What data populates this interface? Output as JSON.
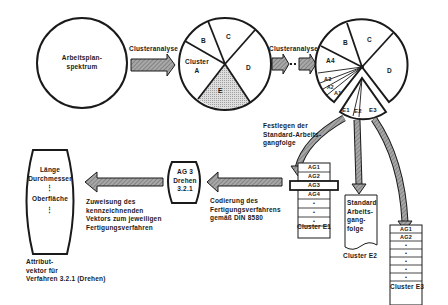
{
  "diagram": {
    "start_circle": {
      "label_line1": "Arbeitsplan-",
      "label_line2": "spektrum"
    },
    "arrow1_label": "Clusteranalyse",
    "arrow2_label": "Clusteranalyse",
    "circle1": {
      "segments": [
        "B",
        "C",
        "D",
        "E"
      ],
      "cluster_a_line1": "Cluster",
      "cluster_a_line2": "A",
      "highlighted_segment": "E",
      "highlight_color": "#cfcfcf"
    },
    "circle2": {
      "segments": [
        "B",
        "C",
        "D",
        "A4",
        "A3",
        "A2",
        "A1"
      ],
      "sub_segments": [
        "E1",
        "E2",
        "E3"
      ]
    },
    "standard_label": {
      "line1": "Festlegen der",
      "line2": "Standard-Arbeits-",
      "line3": "gangfolge"
    },
    "cluster_e1": {
      "rows": [
        "AG1",
        "AG2",
        "AG3",
        "AG4",
        "•",
        "•",
        "•"
      ],
      "caption": "Cluster E1"
    },
    "cluster_e2": {
      "lines": [
        "Standard",
        "Arbeits-",
        "gang-",
        "folge"
      ],
      "caption": "Cluster E2"
    },
    "cluster_e3": {
      "rows": [
        "AG1",
        "AG2",
        "•",
        "•",
        "•",
        "•",
        "•"
      ],
      "caption": "Cluster E3"
    },
    "ag_box": {
      "line1": "AG 3",
      "line2": "Drehen",
      "line3": "3.2.1"
    },
    "coding_label": {
      "line1": "Codierung des",
      "line2": "Fertigungsverfahrens",
      "line3": "gemäß DIN 8580"
    },
    "assign_label": {
      "line1": "Zuweisung des",
      "line2": "kennzeichnenden",
      "line3": "Vektors zum jeweiligen",
      "line4": "Fertigungsverfahren"
    },
    "vector": {
      "item1": "Länge",
      "item2": "Durchmesser",
      "item3": "Oberfläche",
      "dots": "⋮"
    },
    "vector_caption": {
      "line1": "Attribut-",
      "line2": "vektor für",
      "line3": "Verfahren 3.2.1 (Drehen)"
    },
    "colors": {
      "line": "#1a1a1a",
      "arrow_fill": "#9a9a9a",
      "arrow_hatch": "#6a6a6a",
      "shade": "#cfcfcf"
    }
  }
}
